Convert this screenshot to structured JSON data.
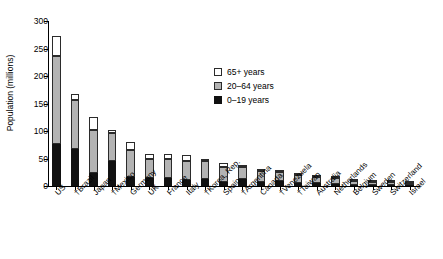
{
  "chart_data": {
    "type": "bar",
    "title": "",
    "subtype": "stacked-vertical",
    "xlabel": "",
    "ylabel": "Population (millions)",
    "ylim": [
      0,
      300
    ],
    "yticks": [
      0,
      50,
      100,
      150,
      200,
      250,
      300
    ],
    "grid": false,
    "legend_position": "inside-upper-center",
    "categories": [
      "US",
      "†Brazil",
      "Japan",
      "†Mexico",
      "Germany",
      "UK",
      "France",
      "Italy",
      "†Korea, Rep.",
      "Spain",
      "†Argentina",
      "Canada",
      "†Venezuela",
      "†Taiwan",
      "Australia",
      "Netherlands",
      "Belgium",
      "Sweden",
      "Switzerland",
      "Israel"
    ],
    "series": [
      {
        "name": "0–19 years",
        "color": "#111111",
        "values": [
          77,
          67,
          23,
          45,
          16,
          14,
          15,
          11,
          13,
          8,
          13,
          7,
          9,
          5,
          5,
          4,
          2.4,
          2.1,
          1.7,
          2.2
        ]
      },
      {
        "name": "20–64 years",
        "color": "#b3b3b3",
        "values": [
          160,
          90,
          79,
          52,
          50,
          36,
          35,
          35,
          32,
          26,
          21,
          20,
          16,
          15,
          12,
          10,
          6.3,
          5.3,
          4.9,
          3.6
        ]
      },
      {
        "name": "65+ years",
        "color": "#ffffff",
        "values": [
          35,
          10,
          23,
          5,
          14,
          9,
          9,
          10,
          3.5,
          7,
          3.5,
          4,
          1.5,
          2,
          2.5,
          2.3,
          1.8,
          1.6,
          1.2,
          0.7
        ]
      }
    ],
    "totals": [
      272,
      167,
      125,
      102,
      80,
      59,
      59,
      56,
      48.5,
      41,
      37.5,
      31,
      26.5,
      22,
      19.5,
      16.3,
      10.5,
      9,
      7.8,
      6.5
    ],
    "legend": [
      {
        "label": "65+ years",
        "swatch": "white"
      },
      {
        "label": "20–64 years",
        "swatch": "gray"
      },
      {
        "label": "0–19 years",
        "swatch": "black"
      }
    ],
    "axis_color": "#000000"
  }
}
